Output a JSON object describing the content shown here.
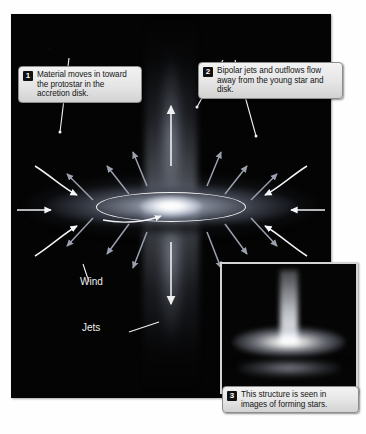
{
  "figure": {
    "background_color": "#ffffff",
    "panel_color": "#040404"
  },
  "main_panel": {
    "name": "protostar-illustration",
    "description": "Artist rendering of a young star surrounded by a glowing accretion disk with bipolar jets above and below"
  },
  "callouts": [
    {
      "number": "1",
      "text": "Material moves in toward the protostar in the accretion disk.",
      "points_to": "infalling-material-arrow"
    },
    {
      "number": "2",
      "text": "Bipolar jets and outflows flow away from the young star and disk.",
      "points_to": "outflow-arrows"
    },
    {
      "number": "3",
      "text": "This structure is seen in images of forming stars.",
      "points_to": "telescope-inset"
    }
  ],
  "labels": [
    {
      "text": "Wind",
      "name": "wind-label"
    },
    {
      "text": "Jets",
      "name": "jets-label"
    }
  ],
  "inset": {
    "name": "telescope-image-inset",
    "description": "Observed image of a forming star showing a jet above a bright edge-on disk",
    "border_color": "#d4d4d4"
  },
  "colors": {
    "panel": "#040404",
    "callout_fill": "#e6e6e6",
    "callout_border": "#8d8d8d",
    "badge": "#111111",
    "label_text": "#f0f0f0",
    "arrow_white": "#ffffff",
    "arrow_gray": "#9aa0ad"
  }
}
